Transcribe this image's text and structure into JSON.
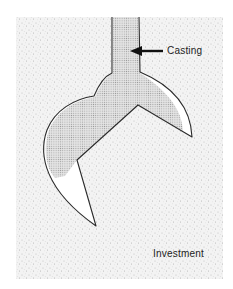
{
  "figure": {
    "labels": {
      "casting": "Casting",
      "investment": "Investment"
    },
    "colors": {
      "investment_fill": "#efefef",
      "investment_speckle": "#bdbdbd",
      "casting_fill": "#d2d2d2",
      "cavity_void": "#ffffff",
      "outline": "#2a2a2a",
      "arrow": "#111111"
    }
  }
}
